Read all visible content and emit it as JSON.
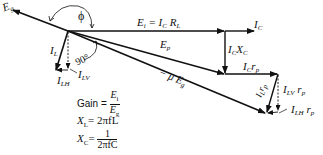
{
  "diagram": {
    "vectors": [
      {
        "id": "Eg",
        "label_main": "E",
        "label_sub": "g"
      },
      {
        "id": "Ei",
        "label_main": "E",
        "label_sub": "i",
        "label_rest": " = I",
        "label_rest_sub": "C",
        "label_rest2": " R",
        "label_rest2_sub": "L"
      },
      {
        "id": "IC",
        "label_main": "I",
        "label_sub": "C"
      },
      {
        "id": "ICXC",
        "label_main": "I",
        "label_sub": "C",
        "label_rest": "X",
        "label_rest_sub": "C"
      },
      {
        "id": "Ep",
        "label_main": "E",
        "label_sub": "p"
      },
      {
        "id": "ICrp",
        "label_main": "I",
        "label_sub": "C",
        "label_rest": "r",
        "label_rest_sub": "p"
      },
      {
        "id": "muEg",
        "label_main": "− μ E",
        "label_sub": "g"
      },
      {
        "id": "ILrp",
        "label_main": "I",
        "label_sub": "L",
        "label_rest": "r",
        "label_rest_sub": "p"
      },
      {
        "id": "ILVrp",
        "label_main": "I",
        "label_sub": "LV",
        "label_rest": " r",
        "label_rest_sub": "p"
      },
      {
        "id": "ILHrp",
        "label_main": "I",
        "label_sub": "LH",
        "label_rest": " r",
        "label_rest_sub": "p"
      },
      {
        "id": "IL",
        "label_main": "I",
        "label_sub": "L"
      },
      {
        "id": "ILV",
        "label_main": "I",
        "label_sub": "LV"
      },
      {
        "id": "ILH",
        "label_main": "I",
        "label_sub": "LH"
      }
    ],
    "angles": {
      "phi": "ϕ",
      "right_angle": "90°"
    },
    "equations": {
      "gain_label": "Gain =",
      "gain_num_main": "E",
      "gain_num_sub": "i",
      "gain_den_main": "E",
      "gain_den_sub": "g",
      "xl_lhs_main": "X",
      "xl_lhs_sub": "L",
      "xl_rhs": "= 2πfL",
      "xc_lhs_main": "X",
      "xc_lhs_sub": "C",
      "xc_eq": "=",
      "xc_num": "1",
      "xc_den": "2πfC"
    }
  }
}
